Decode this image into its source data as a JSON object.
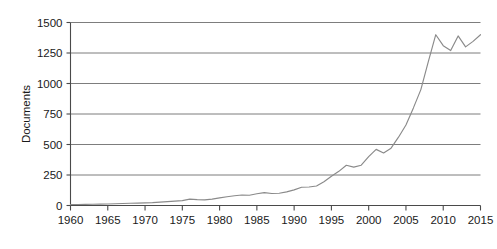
{
  "chart_data": {
    "type": "line",
    "title": "",
    "subtitle": "",
    "xlabel": "",
    "ylabel": "Documents",
    "xlim": [
      1960,
      2015
    ],
    "ylim": [
      0,
      1500
    ],
    "grid": true,
    "legend": false,
    "legend_position": "none",
    "line_color": "#8a8a8a",
    "grid_color": "#6e6e6e",
    "axis_color": "#4a4a4a",
    "background_color": "#ffffff",
    "ytick_labels": [
      "0",
      "250",
      "500",
      "750",
      "1000",
      "1250",
      "1500"
    ],
    "ytick_values": [
      0,
      250,
      500,
      750,
      1000,
      1250,
      1500
    ],
    "xtick_labels": [
      "1960",
      "1965",
      "1970",
      "1975",
      "1980",
      "1985",
      "1990",
      "1995",
      "2000",
      "2005",
      "2010",
      "2015"
    ],
    "xtick_values": [
      1960,
      1965,
      1970,
      1975,
      1980,
      1985,
      1990,
      1995,
      2000,
      2005,
      2010,
      2015
    ],
    "annotations": [],
    "series": [
      {
        "name": "Documents",
        "x": [
          1960,
          1961,
          1962,
          1963,
          1964,
          1965,
          1966,
          1967,
          1968,
          1969,
          1970,
          1971,
          1972,
          1973,
          1974,
          1975,
          1976,
          1977,
          1978,
          1979,
          1980,
          1981,
          1982,
          1983,
          1984,
          1985,
          1986,
          1987,
          1988,
          1989,
          1990,
          1991,
          1992,
          1993,
          1994,
          1995,
          1996,
          1997,
          1998,
          1999,
          2000,
          2001,
          2002,
          2003,
          2004,
          2005,
          2006,
          2007,
          2008,
          2009,
          2010,
          2011,
          2012,
          2013,
          2014,
          2015
        ],
        "values": [
          8,
          8,
          9,
          10,
          11,
          12,
          14,
          16,
          18,
          20,
          22,
          24,
          28,
          32,
          36,
          40,
          52,
          48,
          46,
          52,
          62,
          72,
          80,
          86,
          84,
          96,
          105,
          98,
          100,
          112,
          128,
          150,
          152,
          160,
          195,
          240,
          280,
          330,
          315,
          330,
          400,
          460,
          430,
          470,
          560,
          660,
          800,
          950,
          1180,
          1400,
          1310,
          1270,
          1390,
          1300,
          1345,
          1400
        ]
      }
    ]
  },
  "axis_title": {
    "y": "Documents"
  }
}
